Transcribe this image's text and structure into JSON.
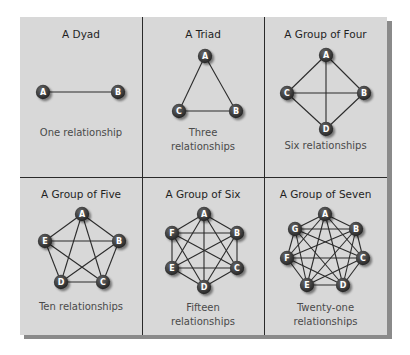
{
  "colors": {
    "panel_bg": "#d8d8d8",
    "divider": "#2a2a2a",
    "edge": "#2b2b2b",
    "node_fill": "#3a3a3a",
    "node_text": "#ffffff",
    "title_text": "#1f1f1f",
    "caption_text": "#4a4a4a"
  },
  "cells": [
    {
      "title": "A Dyad",
      "caption_lines": [
        "One relationship"
      ],
      "box": {
        "x": 20,
        "y": 17,
        "w": 122,
        "h": 160
      },
      "title_y": 28,
      "caption_y": 126,
      "nodes": [
        {
          "label": "A",
          "x": 43,
          "y": 92
        },
        {
          "label": "B",
          "x": 118,
          "y": 92
        }
      ]
    },
    {
      "title": "A Triad",
      "caption_lines": [
        "Three",
        "relationships"
      ],
      "box": {
        "x": 142,
        "y": 17,
        "w": 122,
        "h": 160
      },
      "title_y": 28,
      "caption_y": 126,
      "nodes": [
        {
          "label": "A",
          "x": 205,
          "y": 56
        },
        {
          "label": "B",
          "x": 236,
          "y": 111
        },
        {
          "label": "C",
          "x": 179,
          "y": 111
        }
      ]
    },
    {
      "title": "A Group of Four",
      "caption_lines": [
        "Six relationships"
      ],
      "box": {
        "x": 264,
        "y": 17,
        "w": 123,
        "h": 160
      },
      "title_y": 28,
      "caption_y": 139,
      "nodes": [
        {
          "label": "A",
          "x": 326,
          "y": 55
        },
        {
          "label": "B",
          "x": 364,
          "y": 93
        },
        {
          "label": "C",
          "x": 287,
          "y": 93
        },
        {
          "label": "D",
          "x": 326,
          "y": 129
        }
      ]
    },
    {
      "title": "A Group of Five",
      "caption_lines": [
        "Ten relationships"
      ],
      "box": {
        "x": 20,
        "y": 177,
        "w": 122,
        "h": 158
      },
      "title_y": 188,
      "caption_y": 300,
      "nodes": [
        {
          "label": "A",
          "x": 82,
          "y": 214
        },
        {
          "label": "B",
          "x": 119,
          "y": 241
        },
        {
          "label": "C",
          "x": 103,
          "y": 282
        },
        {
          "label": "D",
          "x": 61,
          "y": 282
        },
        {
          "label": "E",
          "x": 45,
          "y": 241
        }
      ]
    },
    {
      "title": "A Group of Six",
      "caption_lines": [
        "Fifteen",
        "relationships"
      ],
      "box": {
        "x": 142,
        "y": 177,
        "w": 122,
        "h": 158
      },
      "title_y": 188,
      "caption_y": 301,
      "nodes": [
        {
          "label": "A",
          "x": 204,
          "y": 214
        },
        {
          "label": "B",
          "x": 237,
          "y": 233
        },
        {
          "label": "C",
          "x": 237,
          "y": 268
        },
        {
          "label": "D",
          "x": 204,
          "y": 287
        },
        {
          "label": "E",
          "x": 172,
          "y": 268
        },
        {
          "label": "F",
          "x": 172,
          "y": 233
        }
      ]
    },
    {
      "title": "A Group of Seven",
      "caption_lines": [
        "Twenty-one",
        "relationships"
      ],
      "box": {
        "x": 264,
        "y": 177,
        "w": 123,
        "h": 158
      },
      "title_y": 188,
      "caption_y": 301,
      "nodes": [
        {
          "label": "A",
          "x": 325,
          "y": 214
        },
        {
          "label": "B",
          "x": 356,
          "y": 229
        },
        {
          "label": "C",
          "x": 363,
          "y": 258
        },
        {
          "label": "D",
          "x": 343,
          "y": 285
        },
        {
          "label": "E",
          "x": 307,
          "y": 285
        },
        {
          "label": "F",
          "x": 287,
          "y": 258
        },
        {
          "label": "G",
          "x": 295,
          "y": 229
        }
      ]
    }
  ]
}
